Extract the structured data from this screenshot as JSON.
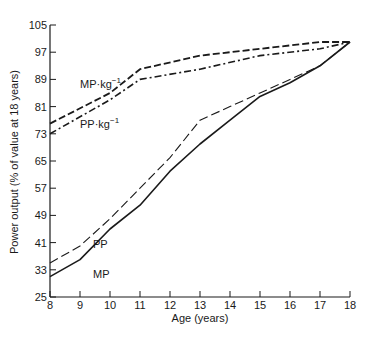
{
  "chart_data": {
    "type": "line",
    "title": "",
    "xlabel": "Age (years)",
    "ylabel": "Power output (% of value at 18 years)",
    "x": [
      8,
      9,
      10,
      11,
      12,
      13,
      14,
      15,
      16,
      17,
      18
    ],
    "xlim": [
      8,
      18
    ],
    "ylim": [
      25,
      105
    ],
    "xticks": [
      "8",
      "9",
      "10",
      "11",
      "12",
      "13",
      "14",
      "15",
      "16",
      "17",
      "18"
    ],
    "yticks": [
      "25",
      "33",
      "41",
      "49",
      "57",
      "65",
      "73",
      "81",
      "89",
      "97",
      "105"
    ],
    "grid": false,
    "legend": "inline labels",
    "series": [
      {
        "name": "MP·kg⁻¹",
        "label_main": "MP·kg",
        "label_sup": "−1",
        "style": "dashed",
        "x": [
          8,
          10,
          11,
          13,
          15,
          17,
          18
        ],
        "values": [
          76,
          85,
          92,
          96,
          98,
          100,
          100
        ]
      },
      {
        "name": "PP·kg⁻¹",
        "label_main": "PP·kg",
        "label_sup": "−1",
        "style": "dash-dot",
        "x": [
          8,
          10,
          11,
          13,
          15,
          17,
          18
        ],
        "values": [
          73,
          83,
          89,
          92,
          96,
          98,
          100
        ]
      },
      {
        "name": "PP",
        "label_main": "PP",
        "label_sup": "",
        "style": "long-dash",
        "x": [
          8,
          9,
          10,
          11,
          12,
          13,
          14,
          15,
          16,
          17,
          18
        ],
        "values": [
          35,
          40,
          48,
          57,
          66,
          77,
          81,
          85,
          89,
          93,
          100
        ]
      },
      {
        "name": "MP",
        "label_main": "MP",
        "label_sup": "",
        "style": "solid",
        "x": [
          8,
          9,
          10,
          11,
          12,
          13,
          14,
          15,
          16,
          17,
          18
        ],
        "values": [
          31,
          36,
          45,
          52,
          62,
          70,
          77,
          84,
          88,
          93,
          100
        ]
      }
    ]
  },
  "colors": {
    "ink": "#1a1a1a",
    "background": "#ffffff"
  }
}
